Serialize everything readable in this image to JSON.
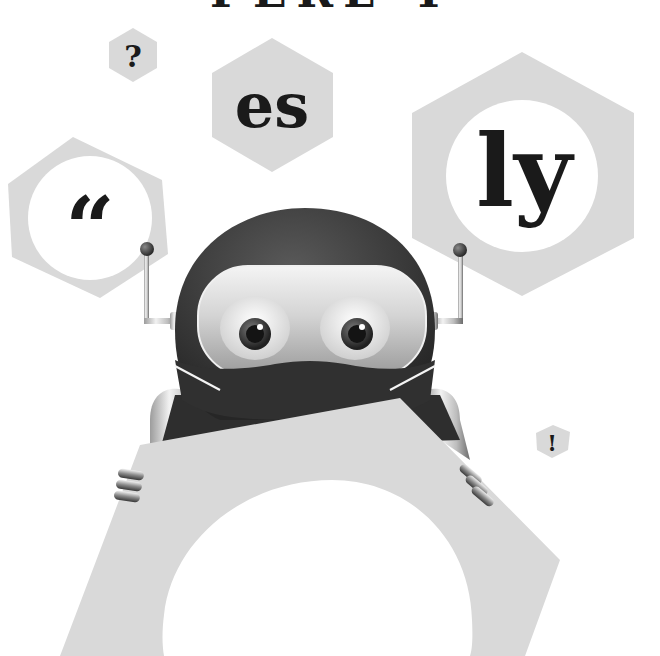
{
  "title_fragment": "PERL 4",
  "hexagons": {
    "question": {
      "glyph": "?"
    },
    "es": {
      "glyph": "es"
    },
    "quote": {
      "glyph": "“"
    },
    "ly": {
      "glyph": "ly"
    },
    "exclaim": {
      "glyph": "!"
    }
  },
  "colors": {
    "background": "#ffffff",
    "hex_fill": "#d9d9d9",
    "glyph": "#1a1a1a",
    "robot_helmet": "#3a3a3a",
    "visor": "#bfbfbf"
  }
}
